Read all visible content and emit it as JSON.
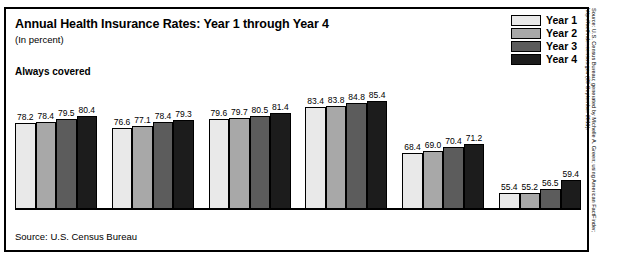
{
  "chart_data": {
    "type": "bar",
    "title": "Annual Health Insurance Rates: Year 1 through Year 4",
    "subtitle": "(In percent)",
    "section_heading": "Always covered",
    "xlabel": "",
    "ylabel": "",
    "ylim": [
      50,
      90
    ],
    "grid": false,
    "legend_position": "top-right",
    "categories": [
      "All",
      "Men",
      "Women",
      "Non-Hispanic Whites",
      "Blacks",
      "Hispanics (any race)"
    ],
    "category_lines": [
      [
        "All"
      ],
      [
        "Men"
      ],
      [
        "Women"
      ],
      [
        "Non-Hispanic",
        "Whites"
      ],
      [
        "Blacks"
      ],
      [
        "Hispanics (any race)"
      ]
    ],
    "series": [
      {
        "name": "Year 1",
        "color": "#e9e9e9",
        "values": [
          78.2,
          76.6,
          79.6,
          83.4,
          68.4,
          55.4
        ]
      },
      {
        "name": "Year 2",
        "color": "#a8a8a8",
        "values": [
          78.4,
          77.1,
          79.7,
          83.8,
          69.0,
          55.2
        ]
      },
      {
        "name": "Year 3",
        "color": "#5c5c5c",
        "values": [
          79.5,
          78.4,
          80.5,
          84.8,
          70.4,
          56.5
        ]
      },
      {
        "name": "Year 4",
        "color": "#1c1c1c",
        "values": [
          80.4,
          79.3,
          81.4,
          85.4,
          71.2,
          59.4
        ]
      }
    ],
    "value_labels": [
      [
        "78.2",
        "78.4",
        "79.5",
        "80.4"
      ],
      [
        "76.6",
        "77.1",
        "78.4",
        "79.3"
      ],
      [
        "79.6",
        "79.7",
        "80.5",
        "81.4"
      ],
      [
        "83.4",
        "83.8",
        "84.8",
        "85.4"
      ],
      [
        "68.4",
        "69.0",
        "70.4",
        "71.2"
      ],
      [
        "55.4",
        "55.2",
        "56.5",
        "59.4"
      ]
    ],
    "source_note": "Source: U.S. Census Bureau"
  },
  "legend": {
    "items": [
      {
        "label": "Year 1",
        "color": "#e9e9e9"
      },
      {
        "label": "Year 2",
        "color": "#a8a8a8"
      },
      {
        "label": "Year 3",
        "color": "#5c5c5c"
      },
      {
        "label": "Year 4",
        "color": "#1c1c1c"
      }
    ]
  },
  "side_credit": {
    "line1": "Source: U.S. Census Bureau; generated by Michelle A. Green; using American FactFinder;",
    "line2": "http://factfinder.census.gov (20 September 2011)."
  }
}
